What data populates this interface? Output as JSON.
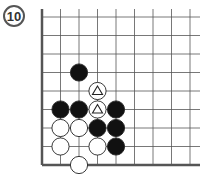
{
  "problem": {
    "number": "10"
  },
  "board": {
    "origin": [
      42,
      17
    ],
    "spacing": 18.5,
    "cols": 9,
    "rows": 9,
    "edges": [
      "left",
      "bottom"
    ],
    "line_color": "#333333",
    "stones": [
      {
        "color": "black",
        "col": 2,
        "row": 3
      },
      {
        "color": "white",
        "col": 3,
        "row": 4,
        "mark": "triangle"
      },
      {
        "color": "black",
        "col": 1,
        "row": 5
      },
      {
        "color": "black",
        "col": 2,
        "row": 5
      },
      {
        "color": "white",
        "col": 3,
        "row": 5,
        "mark": "triangle"
      },
      {
        "color": "black",
        "col": 4,
        "row": 5
      },
      {
        "color": "white",
        "col": 1,
        "row": 6
      },
      {
        "color": "white",
        "col": 2,
        "row": 6
      },
      {
        "color": "black",
        "col": 3,
        "row": 6
      },
      {
        "color": "black",
        "col": 4,
        "row": 6
      },
      {
        "color": "white",
        "col": 1,
        "row": 7
      },
      {
        "color": "white",
        "col": 3,
        "row": 7
      },
      {
        "color": "black",
        "col": 4,
        "row": 7
      },
      {
        "color": "white",
        "col": 2,
        "row": 8
      }
    ]
  }
}
